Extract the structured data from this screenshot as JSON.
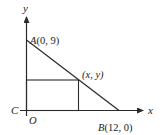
{
  "diagram": {
    "axes": {
      "x_label": "x",
      "y_label": "y"
    },
    "points": {
      "A": {
        "name": "A",
        "coords": "(0, 9)"
      },
      "B": {
        "name": "B",
        "coords": "(12, 0)"
      },
      "P": {
        "label": "(x, y)"
      },
      "C": {
        "label": "C"
      },
      "O": {
        "label": "O"
      }
    },
    "colors": {
      "stroke": "#2a2a2a",
      "background": "#ffffff"
    }
  }
}
